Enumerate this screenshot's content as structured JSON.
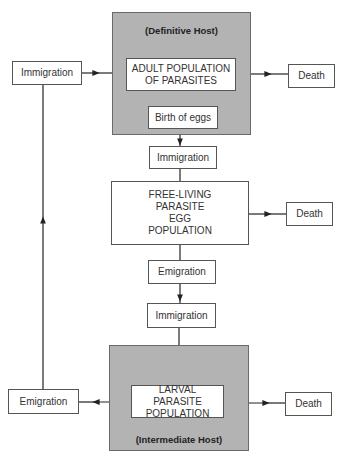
{
  "diagram": {
    "definitive_host": {
      "label": "(Definitive Host)",
      "adult_population": "ADULT POPULATION OF PARASITES",
      "birth_of_eggs": "Birth of eggs"
    },
    "top_row": {
      "immigration_left": "Immigration",
      "death_right": "Death"
    },
    "egg_stage": {
      "immigration": "Immigration",
      "free_living": "FREE-LIVING PARASITE EGG POPULATION",
      "death": "Death",
      "emigration": "Emigration"
    },
    "larval_stage": {
      "immigration": "Immigration",
      "larval_population": "LARVAL PARASITE POPULATION",
      "emigration_left": "Emigration",
      "death_right": "Death"
    },
    "intermediate_host": {
      "label": "(Intermediate Host)"
    },
    "colors": {
      "host_fill": "#b3b3b3",
      "box_fill": "#ffffff",
      "line": "#222222"
    }
  }
}
